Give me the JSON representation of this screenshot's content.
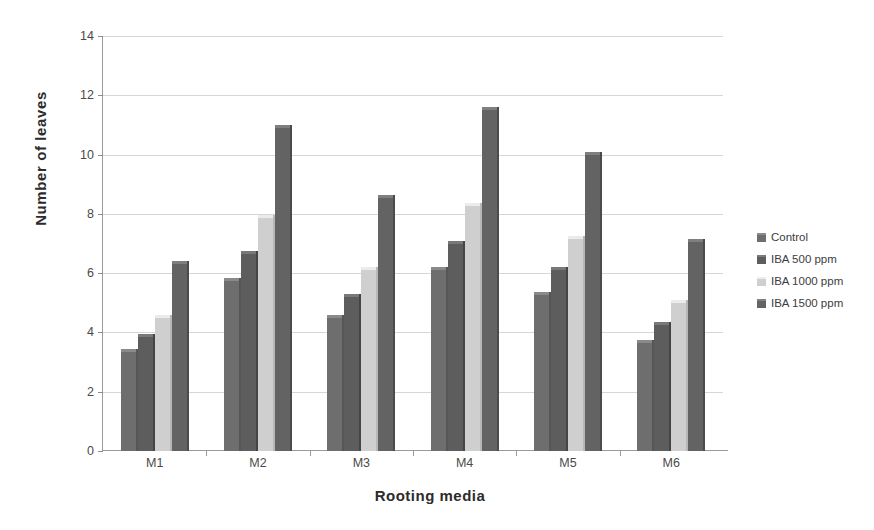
{
  "chart_data": {
    "type": "bar",
    "title": "",
    "xlabel": "Rooting media",
    "ylabel": "Number of  leaves",
    "categories": [
      "M1",
      "M2",
      "M3",
      "M4",
      "M5",
      "M6"
    ],
    "series": [
      {
        "name": "Control",
        "values": [
          3.45,
          5.85,
          4.6,
          6.2,
          5.35,
          3.75
        ],
        "color": "#6e6e6e"
      },
      {
        "name": "IBA 500 ppm",
        "values": [
          3.95,
          6.75,
          5.3,
          7.1,
          6.2,
          4.35
        ],
        "color": "#5d5d5d"
      },
      {
        "name": "IBA 1000 ppm",
        "values": [
          4.6,
          7.95,
          6.2,
          8.35,
          7.25,
          5.1
        ],
        "color": "#cfcfcf"
      },
      {
        "name": "IBA 1500 ppm",
        "values": [
          6.4,
          11.0,
          8.65,
          11.6,
          10.1,
          7.15
        ],
        "color": "#636363"
      }
    ],
    "ylim": [
      0,
      14
    ],
    "yticks": [
      0,
      2,
      4,
      6,
      8,
      10,
      12,
      14
    ],
    "ytick_labels": [
      "0",
      "2",
      "4",
      "6",
      "8",
      "10",
      "12",
      "14"
    ],
    "grid": true,
    "legend_position": "right"
  }
}
